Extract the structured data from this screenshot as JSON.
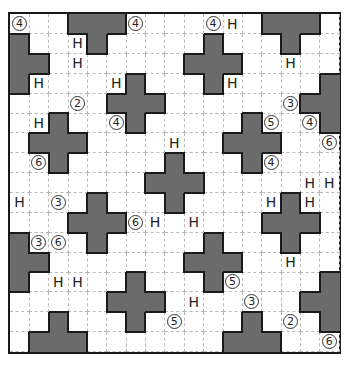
{
  "puzzle": {
    "rows": 17,
    "cols": 17,
    "colors": {
      "shaded": "#6b6b6b",
      "border": "#1a1a1a",
      "grid": "#b8b8b8"
    },
    "shaded": [
      [
        0,
        3
      ],
      [
        0,
        4
      ],
      [
        0,
        5
      ],
      [
        0,
        13
      ],
      [
        0,
        14
      ],
      [
        0,
        15
      ],
      [
        1,
        0
      ],
      [
        1,
        4
      ],
      [
        1,
        10
      ],
      [
        1,
        14
      ],
      [
        2,
        0
      ],
      [
        2,
        1
      ],
      [
        2,
        9
      ],
      [
        2,
        10
      ],
      [
        2,
        11
      ],
      [
        3,
        0
      ],
      [
        3,
        6
      ],
      [
        3,
        10
      ],
      [
        3,
        16
      ],
      [
        4,
        5
      ],
      [
        4,
        6
      ],
      [
        4,
        7
      ],
      [
        4,
        15
      ],
      [
        4,
        16
      ],
      [
        5,
        2
      ],
      [
        5,
        6
      ],
      [
        5,
        12
      ],
      [
        5,
        16
      ],
      [
        6,
        1
      ],
      [
        6,
        2
      ],
      [
        6,
        3
      ],
      [
        6,
        11
      ],
      [
        6,
        12
      ],
      [
        6,
        13
      ],
      [
        7,
        2
      ],
      [
        7,
        8
      ],
      [
        7,
        12
      ],
      [
        8,
        7
      ],
      [
        8,
        8
      ],
      [
        8,
        9
      ],
      [
        9,
        4
      ],
      [
        9,
        8
      ],
      [
        9,
        14
      ],
      [
        10,
        3
      ],
      [
        10,
        4
      ],
      [
        10,
        5
      ],
      [
        10,
        13
      ],
      [
        10,
        14
      ],
      [
        10,
        15
      ],
      [
        11,
        0
      ],
      [
        11,
        4
      ],
      [
        11,
        10
      ],
      [
        11,
        14
      ],
      [
        12,
        0
      ],
      [
        12,
        1
      ],
      [
        12,
        9
      ],
      [
        12,
        10
      ],
      [
        12,
        11
      ],
      [
        13,
        0
      ],
      [
        13,
        6
      ],
      [
        13,
        10
      ],
      [
        13,
        16
      ],
      [
        14,
        5
      ],
      [
        14,
        6
      ],
      [
        14,
        7
      ],
      [
        14,
        15
      ],
      [
        14,
        16
      ],
      [
        15,
        2
      ],
      [
        15,
        6
      ],
      [
        15,
        12
      ],
      [
        15,
        16
      ],
      [
        16,
        1
      ],
      [
        16,
        2
      ],
      [
        16,
        3
      ],
      [
        16,
        11
      ],
      [
        16,
        12
      ],
      [
        16,
        13
      ]
    ],
    "clues": [
      {
        "r": 0,
        "c": 0,
        "type": "num",
        "value": "4"
      },
      {
        "r": 0,
        "c": 6,
        "type": "num",
        "value": "4"
      },
      {
        "r": 0,
        "c": 10,
        "type": "num",
        "value": "4"
      },
      {
        "r": 0,
        "c": 11,
        "type": "h",
        "value": "H"
      },
      {
        "r": 1,
        "c": 3,
        "type": "h",
        "value": "H"
      },
      {
        "r": 2,
        "c": 3,
        "type": "h",
        "value": "H"
      },
      {
        "r": 2,
        "c": 14,
        "type": "h",
        "value": "H"
      },
      {
        "r": 3,
        "c": 1,
        "type": "h",
        "value": "H"
      },
      {
        "r": 3,
        "c": 5,
        "type": "h",
        "value": "H"
      },
      {
        "r": 3,
        "c": 11,
        "type": "h",
        "value": "H"
      },
      {
        "r": 4,
        "c": 3,
        "type": "num",
        "value": "2"
      },
      {
        "r": 4,
        "c": 14,
        "type": "num",
        "value": "3"
      },
      {
        "r": 5,
        "c": 1,
        "type": "h",
        "value": "H"
      },
      {
        "r": 5,
        "c": 5,
        "type": "num",
        "value": "4"
      },
      {
        "r": 5,
        "c": 13,
        "type": "num",
        "value": "5"
      },
      {
        "r": 5,
        "c": 15,
        "type": "num",
        "value": "4"
      },
      {
        "r": 6,
        "c": 8,
        "type": "h",
        "value": "H"
      },
      {
        "r": 6,
        "c": 16,
        "type": "num",
        "value": "6"
      },
      {
        "r": 7,
        "c": 1,
        "type": "num",
        "value": "6"
      },
      {
        "r": 7,
        "c": 13,
        "type": "num",
        "value": "4"
      },
      {
        "r": 8,
        "c": 15,
        "type": "h",
        "value": "H"
      },
      {
        "r": 8,
        "c": 16,
        "type": "h",
        "value": "H"
      },
      {
        "r": 9,
        "c": 0,
        "type": "h",
        "value": "H"
      },
      {
        "r": 9,
        "c": 2,
        "type": "num",
        "value": "3"
      },
      {
        "r": 9,
        "c": 13,
        "type": "h",
        "value": "H"
      },
      {
        "r": 9,
        "c": 15,
        "type": "h",
        "value": "H"
      },
      {
        "r": 10,
        "c": 6,
        "type": "num",
        "value": "6"
      },
      {
        "r": 10,
        "c": 7,
        "type": "h",
        "value": "H"
      },
      {
        "r": 10,
        "c": 9,
        "type": "h",
        "value": "H"
      },
      {
        "r": 11,
        "c": 1,
        "type": "num",
        "value": "3"
      },
      {
        "r": 11,
        "c": 2,
        "type": "num",
        "value": "6"
      },
      {
        "r": 12,
        "c": 14,
        "type": "h",
        "value": "H"
      },
      {
        "r": 13,
        "c": 2,
        "type": "h",
        "value": "H"
      },
      {
        "r": 13,
        "c": 3,
        "type": "h",
        "value": "H"
      },
      {
        "r": 13,
        "c": 11,
        "type": "num",
        "value": "5"
      },
      {
        "r": 14,
        "c": 9,
        "type": "h",
        "value": "H"
      },
      {
        "r": 14,
        "c": 12,
        "type": "num",
        "value": "3"
      },
      {
        "r": 15,
        "c": 8,
        "type": "num",
        "value": "5"
      },
      {
        "r": 15,
        "c": 14,
        "type": "num",
        "value": "2"
      },
      {
        "r": 16,
        "c": 16,
        "type": "num",
        "value": "6"
      }
    ]
  }
}
